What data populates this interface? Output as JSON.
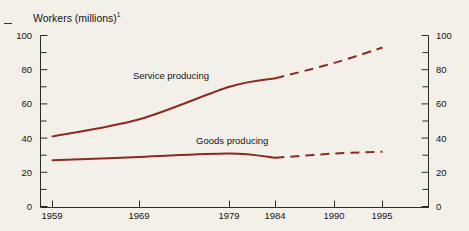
{
  "chart_data": {
    "type": "line",
    "title": "Workers (millions)",
    "title_footnote": "1",
    "xlabel": "",
    "ylabel": "Workers (millions)",
    "ylim": [
      0,
      100
    ],
    "ytick_labels": [
      "0",
      "20",
      "40",
      "60",
      "80",
      "100"
    ],
    "ytick_values": [
      0,
      20,
      40,
      60,
      80,
      100
    ],
    "yminor_values": [
      10,
      30,
      50,
      70,
      90
    ],
    "grid": false,
    "legend_position": "inline-annotations",
    "dual_y_axis": true,
    "right_axis_tick_labels": [
      "0",
      "20",
      "40",
      "60",
      "80",
      "100"
    ],
    "categories": [
      "1959",
      "1969",
      "1979",
      "1984",
      "1990",
      "1995"
    ],
    "x": [
      1959,
      1969,
      1979,
      1984,
      1990,
      1995
    ],
    "projection_starts_at": "1984",
    "series": [
      {
        "name": "Service producing",
        "values": [
          41,
          51,
          70,
          75,
          84,
          93
        ],
        "color": "#8B2B20",
        "solid_through": "1984",
        "dashed_after": "1984"
      },
      {
        "name": "Goods producing",
        "values": [
          27,
          29,
          31,
          28.5,
          31,
          32
        ],
        "color": "#8B2B20",
        "solid_through": "1984",
        "dashed_after": "1984"
      }
    ],
    "annotations": [
      {
        "text": "Service producing",
        "x_px": 133,
        "y_px": 70
      },
      {
        "text": "Goods producing",
        "x_px": 196,
        "y_px": 135
      }
    ]
  },
  "axes": {
    "left_labels": [
      "100",
      "80",
      "60",
      "40",
      "20",
      "0"
    ],
    "right_labels": [
      "100",
      "80",
      "60",
      "40",
      "20",
      "0"
    ],
    "x_labels": [
      "1959",
      "1969",
      "1979",
      "1984",
      "1990",
      "1995"
    ]
  },
  "colors": {
    "line": "#8B2B20",
    "axis": "#2b2b2b",
    "text": "#141414",
    "background": "#f3f0e9"
  }
}
